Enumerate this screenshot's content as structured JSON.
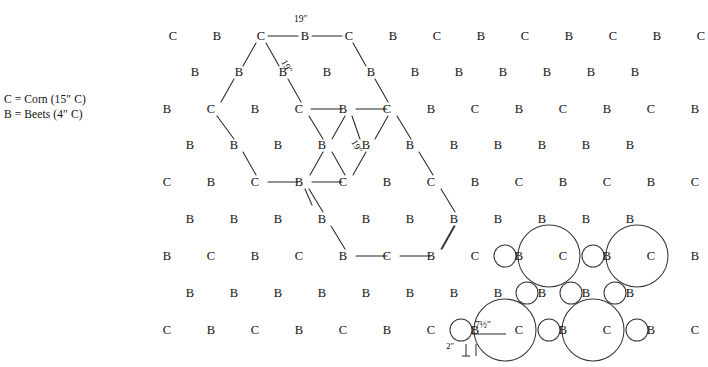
{
  "legend": {
    "corn": "C = Corn  (15″ C)",
    "beets": "B = Beets  (4″ C)"
  },
  "lattice": {
    "rows": [
      {
        "y": 36,
        "x0": 173,
        "step": 44,
        "letters": [
          "C",
          "B",
          "C",
          "B",
          "C",
          "B",
          "C",
          "B",
          "C",
          "B",
          "C",
          "B",
          "C"
        ]
      },
      {
        "y": 72,
        "x0": 195,
        "step": 44,
        "letters": [
          "B",
          "B",
          "B",
          "B",
          "B",
          "B",
          "B",
          "B",
          "B",
          "B",
          "B"
        ]
      },
      {
        "y": 109,
        "x0": 167,
        "step": 44,
        "letters": [
          "B",
          "C",
          "B",
          "C",
          "B",
          "C",
          "B",
          "C",
          "B",
          "C",
          "B",
          "C",
          "B"
        ]
      },
      {
        "y": 145,
        "x0": 190,
        "step": 44,
        "letters": [
          "B",
          "B",
          "B",
          "B",
          "B",
          "B",
          "B",
          "B",
          "B",
          "B",
          "B"
        ]
      },
      {
        "y": 182,
        "x0": 167,
        "step": 44,
        "letters": [
          "C",
          "B",
          "C",
          "B",
          "C",
          "B",
          "C",
          "B",
          "C",
          "B",
          "C",
          "B",
          "C"
        ]
      },
      {
        "y": 219,
        "x0": 190,
        "step": 44,
        "letters": [
          "B",
          "B",
          "B",
          "B",
          "B",
          "B",
          "B",
          "B",
          "B",
          "B",
          "B"
        ]
      },
      {
        "y": 256,
        "x0": 167,
        "step": 44,
        "letters": [
          "B",
          "C",
          "B",
          "C",
          "B",
          "C",
          "B",
          "C",
          "B",
          "C",
          "B",
          "C",
          "B"
        ]
      },
      {
        "y": 293,
        "x0": 190,
        "step": 44,
        "letters": [
          "B",
          "B",
          "B",
          "B",
          "B",
          "B",
          "B",
          "B",
          "B",
          "B",
          "B"
        ]
      },
      {
        "y": 330,
        "x0": 167,
        "step": 44,
        "letters": [
          "C",
          "B",
          "C",
          "B",
          "C",
          "B",
          "C",
          "B",
          "C",
          "B",
          "C",
          "B",
          "C"
        ]
      }
    ]
  },
  "dimensions": {
    "top_span": "19″",
    "diag_upper": "19″",
    "diag_center": "19″",
    "corn_radius": "7½″",
    "beet_gap": "2″"
  },
  "colors": {
    "ink": "#14110f",
    "line": "#2a2622",
    "circle": "#3a3631",
    "background": "#ffffff"
  }
}
